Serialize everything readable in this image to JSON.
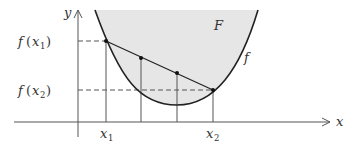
{
  "diagram": {
    "colors": {
      "region_fill": "#e6e6e6",
      "curve": "#222222",
      "axes": "#555555",
      "guide_lines": "#555555",
      "text": "#333333"
    },
    "axes": {
      "x_label": "x",
      "y_label": "y"
    },
    "curve": {
      "label": "f",
      "region_label": "F"
    },
    "x_ticks": [
      {
        "name": "x1",
        "base": "x",
        "sub": "1"
      },
      {
        "name": "x2",
        "base": "x",
        "sub": "2"
      }
    ],
    "y_ticks": [
      {
        "name": "f(x1)",
        "func": "f",
        "arg_base": "x",
        "arg_sub": "1"
      },
      {
        "name": "f(x2)",
        "func": "f",
        "arg_base": "x",
        "arg_sub": "2"
      }
    ],
    "points": [
      {
        "name": "P1",
        "desc": "(x1, f(x1)) on curve"
      },
      {
        "name": "Q1",
        "desc": "intermediate point on chord"
      },
      {
        "name": "Q2",
        "desc": "intermediate point on chord"
      },
      {
        "name": "P2",
        "desc": "(x2, f(x2)) on curve"
      }
    ]
  }
}
